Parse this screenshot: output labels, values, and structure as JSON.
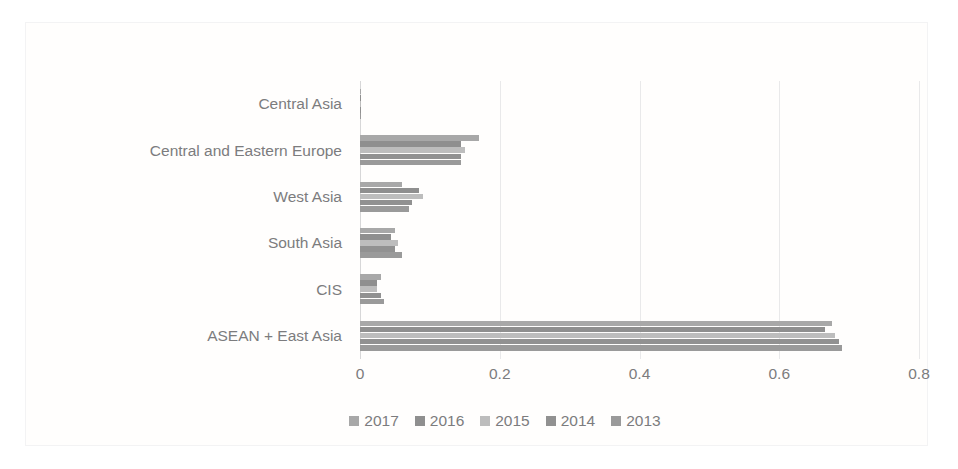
{
  "chart_data": {
    "type": "bar",
    "orientation": "horizontal",
    "title": "",
    "xlabel": "",
    "ylabel": "",
    "xlim": [
      0,
      0.8
    ],
    "xticks": [
      "0",
      "0.2",
      "0.4",
      "0.6",
      "0.8"
    ],
    "xtick_values": [
      0,
      0.2,
      0.4,
      0.6,
      0.8
    ],
    "grid": true,
    "grid_axis": "x",
    "legend_position": "bottom",
    "categories": [
      "Central Asia",
      "Central and Eastern Europe",
      "West Asia",
      "South Asia",
      "CIS",
      "ASEAN + East Asia"
    ],
    "series": [
      {
        "name": "2017",
        "color": "#a8a8a8",
        "values": [
          0.002,
          0.17,
          0.06,
          0.05,
          0.03,
          0.675
        ]
      },
      {
        "name": "2016",
        "color": "#8f8f8f",
        "values": [
          0.002,
          0.145,
          0.085,
          0.045,
          0.025,
          0.665
        ]
      },
      {
        "name": "2015",
        "color": "#bdbdbd",
        "values": [
          0.002,
          0.15,
          0.09,
          0.055,
          0.025,
          0.68
        ]
      },
      {
        "name": "2014",
        "color": "#919191",
        "values": [
          0.002,
          0.145,
          0.075,
          0.05,
          0.03,
          0.685
        ]
      },
      {
        "name": "2013",
        "color": "#9a9a9a",
        "values": [
          0.002,
          0.145,
          0.07,
          0.06,
          0.035,
          0.69
        ]
      }
    ]
  },
  "legend": {
    "entries": [
      {
        "label": "2017",
        "color": "#a8a8a8"
      },
      {
        "label": "2016",
        "color": "#8f8f8f"
      },
      {
        "label": "2015",
        "color": "#bdbdbd"
      },
      {
        "label": "2014",
        "color": "#919191"
      },
      {
        "label": "2013",
        "color": "#9a9a9a"
      }
    ]
  },
  "style": {
    "background": "#ffffff",
    "text_color": "#7c7c7e",
    "gridline_color": "#e9e9ea",
    "axis_color": "#d7d7d8",
    "frame_border": "#ececed"
  }
}
